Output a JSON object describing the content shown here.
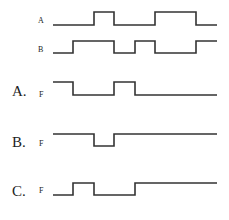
{
  "diagram": {
    "type": "timing-diagram",
    "x_start": 53,
    "x_end": 217,
    "edge_positions": [
      53,
      73,
      94,
      114,
      135,
      155,
      196,
      217
    ],
    "inputs": [
      {
        "label": "A",
        "label_x": 40,
        "label_y": 22,
        "high_y": 12,
        "low_y": 25,
        "segments": [
          [
            53,
            0
          ],
          [
            94,
            1
          ],
          [
            114,
            0
          ],
          [
            155,
            1
          ],
          [
            196,
            0
          ],
          [
            217,
            0
          ]
        ]
      },
      {
        "label": "B",
        "label_x": 40,
        "label_y": 51,
        "high_y": 41,
        "low_y": 53,
        "segments": [
          [
            53,
            0
          ],
          [
            73,
            1
          ],
          [
            114,
            0
          ],
          [
            135,
            1
          ],
          [
            155,
            0
          ],
          [
            196,
            1
          ],
          [
            217,
            1
          ]
        ]
      }
    ],
    "options": [
      {
        "option_label": "A.",
        "signal_label": "F",
        "label_y": 95,
        "high_y": 82,
        "low_y": 95,
        "segments": [
          [
            53,
            1
          ],
          [
            73,
            0
          ],
          [
            114,
            1
          ],
          [
            135,
            0
          ],
          [
            217,
            0
          ]
        ]
      },
      {
        "option_label": "B.",
        "signal_label": "F",
        "label_y": 146,
        "high_y": 134,
        "low_y": 146,
        "segments": [
          [
            53,
            1
          ],
          [
            94,
            0
          ],
          [
            114,
            1
          ],
          [
            217,
            1
          ]
        ]
      },
      {
        "option_label": "C.",
        "signal_label": "F",
        "label_y": 195,
        "high_y": 183,
        "low_y": 195,
        "segments": [
          [
            53,
            0
          ],
          [
            73,
            1
          ],
          [
            94,
            0
          ],
          [
            135,
            1
          ],
          [
            217,
            1
          ]
        ]
      }
    ]
  }
}
